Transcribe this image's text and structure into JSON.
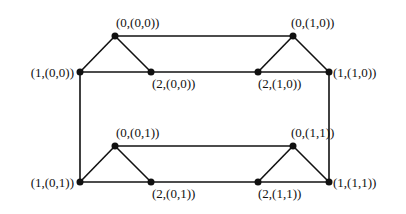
{
  "diagram": {
    "type": "graph",
    "colors": {
      "stroke": "#111111",
      "node": "#111111",
      "background": "#ffffff"
    },
    "nodes": [
      {
        "id": "n000",
        "label": "(0,(0,0))",
        "x": 115,
        "y": 36
      },
      {
        "id": "n100",
        "label": "(1,(0,0))",
        "x": 80,
        "y": 72
      },
      {
        "id": "n200",
        "label": "(2,(0,0))",
        "x": 151,
        "y": 72
      },
      {
        "id": "n010",
        "label": "(0,(1,0))",
        "x": 293,
        "y": 36
      },
      {
        "id": "n110",
        "label": "(1,(1,0))",
        "x": 329,
        "y": 72
      },
      {
        "id": "n210",
        "label": "(2,(1,0))",
        "x": 258,
        "y": 72
      },
      {
        "id": "n001",
        "label": "(0,(0,1))",
        "x": 115,
        "y": 146
      },
      {
        "id": "n101",
        "label": "(1,(0,1))",
        "x": 80,
        "y": 182
      },
      {
        "id": "n201",
        "label": "(2,(0,1))",
        "x": 151,
        "y": 182
      },
      {
        "id": "n011",
        "label": "(0,(1,1))",
        "x": 293,
        "y": 146
      },
      {
        "id": "n111",
        "label": "(1,(1,1))",
        "x": 329,
        "y": 182
      },
      {
        "id": "n211",
        "label": "(2,(1,1))",
        "x": 258,
        "y": 182
      }
    ],
    "edges": [
      [
        "n000",
        "n100"
      ],
      [
        "n000",
        "n200"
      ],
      [
        "n100",
        "n200"
      ],
      [
        "n010",
        "n110"
      ],
      [
        "n010",
        "n210"
      ],
      [
        "n110",
        "n210"
      ],
      [
        "n001",
        "n101"
      ],
      [
        "n001",
        "n201"
      ],
      [
        "n101",
        "n201"
      ],
      [
        "n011",
        "n111"
      ],
      [
        "n011",
        "n211"
      ],
      [
        "n111",
        "n211"
      ],
      [
        "n000",
        "n010"
      ],
      [
        "n200",
        "n210"
      ],
      [
        "n001",
        "n011"
      ],
      [
        "n201",
        "n211"
      ],
      [
        "n100",
        "n101"
      ],
      [
        "n110",
        "n111"
      ]
    ],
    "labels": {
      "n000": "(0,(0,0))",
      "n100": "(1,(0,0))",
      "n200": "(2,(0,0))",
      "n010": "(0,(1,0))",
      "n110": "(1,(1,0))",
      "n210": "(2,(1,0))",
      "n001": "(0,(0,1))",
      "n101": "(1,(0,1))",
      "n201": "(2,(0,1))",
      "n011": "(0,(1,1))",
      "n111": "(1,(1,1))",
      "n211": "(2,(1,1))"
    }
  }
}
